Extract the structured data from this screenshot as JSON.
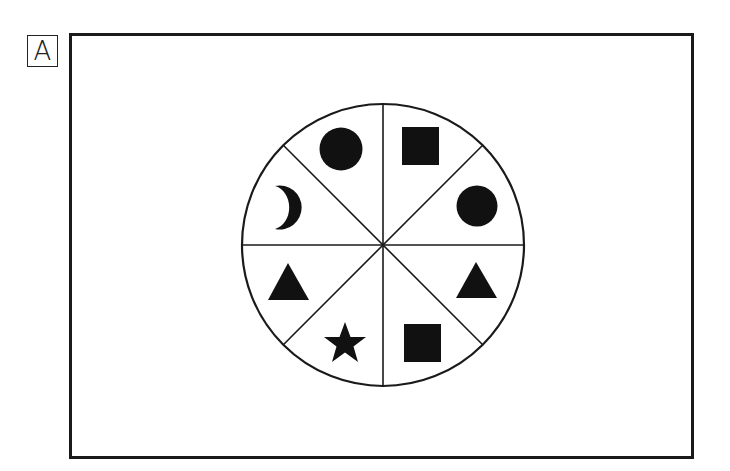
{
  "panel": {
    "label": "A"
  },
  "wheel": {
    "center": [
      383,
      245
    ],
    "radius": 141,
    "segments": 8,
    "stroke_color": "#1a1a1a",
    "fill_color": "#111111",
    "sectors": [
      {
        "position": "top-left-upper",
        "shape": "circle"
      },
      {
        "position": "top-right-upper",
        "shape": "square"
      },
      {
        "position": "right-upper",
        "shape": "circle"
      },
      {
        "position": "right-lower",
        "shape": "triangle"
      },
      {
        "position": "bottom-right",
        "shape": "square"
      },
      {
        "position": "bottom-left",
        "shape": "star"
      },
      {
        "position": "left-lower",
        "shape": "triangle"
      },
      {
        "position": "left-upper",
        "shape": "crescent"
      }
    ]
  }
}
